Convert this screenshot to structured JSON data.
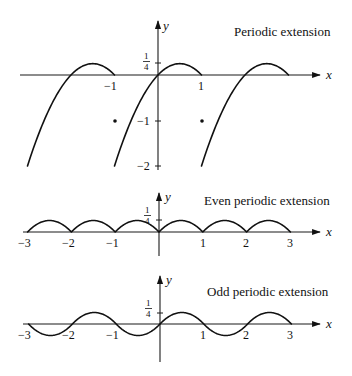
{
  "figure": {
    "panels": [
      {
        "id": "periodic",
        "title": "Periodic extension",
        "x_axis_label": "x",
        "y_axis_label": "y",
        "x_tick_labels": [
          "−1",
          "1"
        ],
        "y_tick_labels": [
          "1/4",
          "−1",
          "−2"
        ]
      },
      {
        "id": "even",
        "title": "Even periodic extension",
        "x_axis_label": "x",
        "y_axis_label": "y",
        "x_tick_labels": [
          "−3",
          "−2",
          "−1",
          "1",
          "2",
          "3"
        ],
        "y_tick_labels": [
          "1/4"
        ]
      },
      {
        "id": "odd",
        "title": "Odd periodic extension",
        "x_axis_label": "x",
        "y_axis_label": "y",
        "x_tick_labels": [
          "−3",
          "−2",
          "−1",
          "1",
          "2",
          "3"
        ],
        "y_tick_labels": [
          "1/4"
        ]
      }
    ]
  },
  "chart_data": [
    {
      "type": "line",
      "title": "Periodic extension",
      "xlabel": "x",
      "ylabel": "y",
      "function": "f(x) = x - x^2 on (-1, 1], period 2",
      "xlim": [
        -3.2,
        3.7
      ],
      "ylim": [
        -2,
        0.25
      ],
      "x_ticks": [
        -1,
        1
      ],
      "y_ticks": [
        0.25,
        -1,
        -2
      ],
      "series": [
        {
          "name": "branch_-2",
          "x": [
            -3,
            -2.5,
            -2,
            -1.5,
            -1
          ],
          "y": [
            -2,
            -0.75,
            0,
            0.25,
            0
          ]
        },
        {
          "name": "branch_0",
          "x": [
            -1,
            -0.5,
            0,
            0.5,
            1
          ],
          "y": [
            -2,
            -0.75,
            0,
            0.25,
            0
          ]
        },
        {
          "name": "branch_2",
          "x": [
            1,
            1.5,
            2,
            2.5,
            3
          ],
          "y": [
            -2,
            -0.75,
            0,
            0.25,
            0
          ]
        }
      ],
      "points": [
        {
          "x": -1,
          "y": -1
        },
        {
          "x": 1,
          "y": -1
        }
      ],
      "grid": false
    },
    {
      "type": "line",
      "title": "Even periodic extension",
      "xlabel": "x",
      "ylabel": "y",
      "function": "|x| - x^2 on [-1,1], period 2",
      "xlim": [
        -3,
        3
      ],
      "ylim": [
        0,
        0.25
      ],
      "x_ticks": [
        -3,
        -2,
        -1,
        1,
        2,
        3
      ],
      "y_ticks": [
        0.25
      ],
      "series": [
        {
          "name": "even",
          "x": [
            -3,
            -2.5,
            -2,
            -1.5,
            -1,
            -0.5,
            0,
            0.5,
            1,
            1.5,
            2,
            2.5,
            3
          ],
          "y": [
            0,
            0.25,
            0,
            0.25,
            0,
            0.25,
            0,
            0.25,
            0,
            0.25,
            0,
            0.25,
            0
          ]
        }
      ],
      "grid": false
    },
    {
      "type": "line",
      "title": "Odd periodic extension",
      "xlabel": "x",
      "ylabel": "y",
      "function": "x - x|x| on [-1,1], period 2",
      "xlim": [
        -3,
        3
      ],
      "ylim": [
        -0.25,
        0.25
      ],
      "x_ticks": [
        -3,
        -2,
        -1,
        1,
        2,
        3
      ],
      "y_ticks": [
        0.25
      ],
      "series": [
        {
          "name": "odd",
          "x": [
            -3,
            -2.5,
            -2,
            -1.5,
            -1,
            -0.5,
            0,
            0.5,
            1,
            1.5,
            2,
            2.5,
            3
          ],
          "y": [
            0,
            -0.25,
            0,
            0.25,
            0,
            -0.25,
            0,
            0.25,
            0,
            -0.25,
            0,
            0.25,
            0
          ]
        }
      ],
      "grid": false
    }
  ]
}
